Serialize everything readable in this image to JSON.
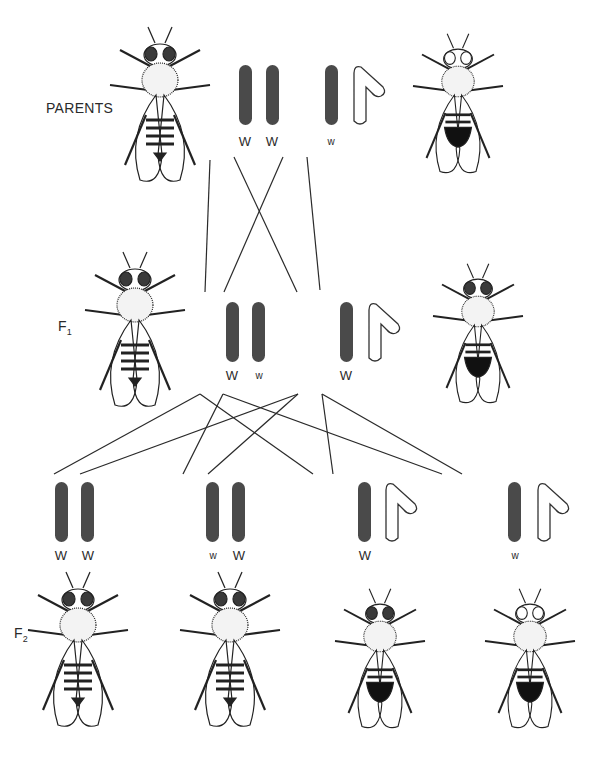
{
  "diagram": {
    "colors": {
      "x_chromosome": "#4a4a4a",
      "y_chromosome_fill": "#ffffff",
      "line": "#2a2a2a"
    },
    "generations": [
      {
        "label": "PARENTS",
        "label_pos": [
          46,
          100
        ]
      },
      {
        "label": "F",
        "subscript": "1",
        "label_pos": [
          58,
          318
        ]
      },
      {
        "label": "F",
        "subscript": "2",
        "label_pos": [
          14,
          625
        ]
      }
    ],
    "parents": {
      "female": {
        "eye": "red",
        "genotype": [
          "W",
          "W"
        ],
        "alleles": [
          {
            "text": "W",
            "x": 245,
            "y": 134,
            "small": false
          },
          {
            "text": "W",
            "x": 272,
            "y": 134,
            "small": false
          }
        ]
      },
      "male": {
        "eye": "white",
        "genotype": [
          "w",
          "Y"
        ],
        "alleles": [
          {
            "text": "w",
            "x": 331,
            "y": 136,
            "small": true
          }
        ]
      }
    },
    "f1": {
      "female": {
        "eye": "red",
        "genotype": [
          "W",
          "w"
        ],
        "alleles": [
          {
            "text": "W",
            "x": 232,
            "y": 368,
            "small": false
          },
          {
            "text": "w",
            "x": 259,
            "y": 370,
            "small": true
          }
        ]
      },
      "male": {
        "eye": "red",
        "genotype": [
          "W",
          "Y"
        ],
        "alleles": [
          {
            "text": "W",
            "x": 346,
            "y": 368,
            "small": false
          }
        ]
      }
    },
    "f2": [
      {
        "sex": "female",
        "eye": "red",
        "genotype": [
          "W",
          "W"
        ],
        "alleles": [
          {
            "text": "W",
            "x": 61,
            "y": 548,
            "small": false
          },
          {
            "text": "W",
            "x": 88,
            "y": 548,
            "small": false
          }
        ]
      },
      {
        "sex": "female",
        "eye": "red",
        "genotype": [
          "w",
          "W"
        ],
        "alleles": [
          {
            "text": "w",
            "x": 213,
            "y": 550,
            "small": true
          },
          {
            "text": "W",
            "x": 239,
            "y": 548,
            "small": false
          }
        ]
      },
      {
        "sex": "male",
        "eye": "red",
        "genotype": [
          "W",
          "Y"
        ],
        "alleles": [
          {
            "text": "W",
            "x": 365,
            "y": 548,
            "small": false
          }
        ]
      },
      {
        "sex": "male",
        "eye": "white",
        "genotype": [
          "w",
          "Y"
        ],
        "alleles": [
          {
            "text": "w",
            "x": 515,
            "y": 550,
            "small": true
          }
        ]
      }
    ],
    "chromosomes": {
      "x_bars": [
        [
          239,
          65
        ],
        [
          266,
          65
        ],
        [
          325,
          65
        ],
        [
          226,
          302
        ],
        [
          252,
          302
        ],
        [
          340,
          302
        ],
        [
          55,
          482
        ],
        [
          81,
          482
        ],
        [
          206,
          482
        ],
        [
          232,
          482
        ],
        [
          358,
          482
        ],
        [
          508,
          482
        ]
      ],
      "y_shapes": [
        [
          353,
          65
        ],
        [
          368,
          302
        ],
        [
          385,
          482
        ],
        [
          537,
          482
        ]
      ]
    },
    "cross_lines": [
      [
        210,
        160,
        205,
        292
      ],
      [
        234,
        157,
        297,
        292
      ],
      [
        283,
        157,
        224,
        292
      ],
      [
        307,
        157,
        320,
        290
      ],
      [
        200,
        394,
        54,
        474
      ],
      [
        200,
        394,
        313,
        474
      ],
      [
        223,
        394,
        183,
        474
      ],
      [
        223,
        394,
        442,
        474
      ],
      [
        298,
        394,
        80,
        474
      ],
      [
        298,
        394,
        208,
        474
      ],
      [
        322,
        394,
        333,
        474
      ],
      [
        322,
        394,
        462,
        474
      ]
    ],
    "flies": [
      {
        "id": "parent-female",
        "x": 160,
        "y": 95,
        "scale": 1.0,
        "eye": "red",
        "sex": "female"
      },
      {
        "id": "parent-male",
        "x": 458,
        "y": 95,
        "scale": 0.9,
        "eye": "white",
        "sex": "male"
      },
      {
        "id": "f1-female",
        "x": 135,
        "y": 320,
        "scale": 1.0,
        "eye": "red",
        "sex": "female"
      },
      {
        "id": "f1-male",
        "x": 478,
        "y": 325,
        "scale": 0.9,
        "eye": "red",
        "sex": "male"
      },
      {
        "id": "f2-female-1",
        "x": 78,
        "y": 640,
        "scale": 1.0,
        "eye": "red",
        "sex": "female"
      },
      {
        "id": "f2-female-2",
        "x": 230,
        "y": 640,
        "scale": 1.0,
        "eye": "red",
        "sex": "female"
      },
      {
        "id": "f2-male-red",
        "x": 380,
        "y": 650,
        "scale": 0.9,
        "eye": "red",
        "sex": "male"
      },
      {
        "id": "f2-male-white",
        "x": 530,
        "y": 650,
        "scale": 0.9,
        "eye": "white",
        "sex": "male"
      }
    ]
  }
}
